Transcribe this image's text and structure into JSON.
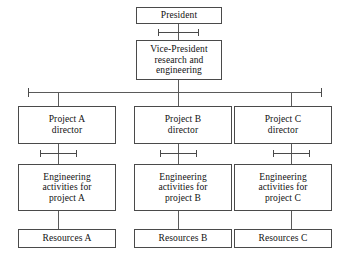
{
  "diagram": {
    "type": "organization-chart",
    "colors": {
      "background": "#ffffff",
      "box_border": "#4a4a4a",
      "connector": "#5a5a5a",
      "text": "#111111"
    },
    "nodes": {
      "president": {
        "label": "President"
      },
      "vice_president": {
        "label": "Vice-President\nresearch and\nengineering"
      },
      "director_a": {
        "label": "Project A\ndirector"
      },
      "director_b": {
        "label": "Project B\ndirector"
      },
      "director_c": {
        "label": "Project C\ndirector"
      },
      "engineering_a": {
        "label": "Engineering\nactivities for\nproject A"
      },
      "engineering_b": {
        "label": "Engineering\nactivities for\nproject B"
      },
      "engineering_c": {
        "label": "Engineering\nactivities for\nproject C"
      },
      "resources_a": {
        "label": "Resources A"
      },
      "resources_b": {
        "label": "Resources B"
      },
      "resources_c": {
        "label": "Resources C"
      }
    },
    "edges": [
      {
        "from": "president",
        "to": "vice_president",
        "style": "dimension-marker"
      },
      {
        "from": "vice_president",
        "to": "bus",
        "style": "line"
      },
      {
        "from": "bus",
        "to": "director_a",
        "style": "line"
      },
      {
        "from": "bus",
        "to": "director_b",
        "style": "line"
      },
      {
        "from": "bus",
        "to": "director_c",
        "style": "line"
      },
      {
        "from": "director_a",
        "to": "engineering_a",
        "style": "dimension-marker"
      },
      {
        "from": "director_b",
        "to": "engineering_b",
        "style": "dimension-marker"
      },
      {
        "from": "director_c",
        "to": "engineering_c",
        "style": "dimension-marker"
      },
      {
        "from": "engineering_a",
        "to": "resources_a",
        "style": "line"
      },
      {
        "from": "engineering_b",
        "to": "resources_b",
        "style": "line"
      },
      {
        "from": "engineering_c",
        "to": "resources_c",
        "style": "line"
      }
    ]
  }
}
